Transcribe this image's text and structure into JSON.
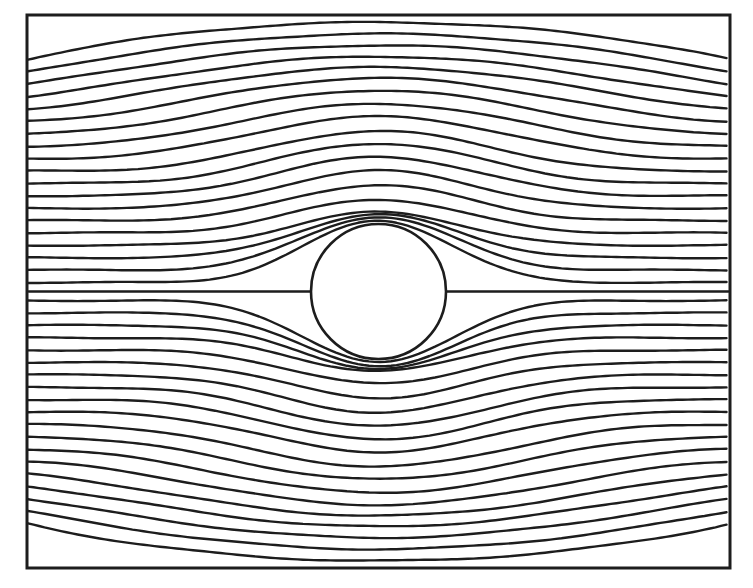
{
  "figure": {
    "background": "#ffffff",
    "ink": "#1d1d1d",
    "canvas": {
      "width": 753,
      "height": 588
    },
    "frame": {
      "x": 27,
      "y": 15,
      "width": 703,
      "height": 553,
      "stroke_width": 3.0
    },
    "cylinder": {
      "cx": 378.5,
      "cy": 291.5,
      "r": 67.5,
      "stroke_width": 2.6
    },
    "stagnation_line": {
      "y": 291.5,
      "left_x1": 28.5,
      "left_x2": 312.5,
      "right_x1": 444.5,
      "right_x2": 728.5,
      "stroke_width": 2.3
    }
  },
  "chart_data": {
    "type": "line",
    "title": "",
    "grid": false,
    "legend": false,
    "n_streamlines_per_side": 19,
    "center_x": 378.5,
    "center_y": 291.5,
    "half_width": 351.5,
    "half_height": 276.5,
    "edge_compression_k": 0.9,
    "inlet_offsets": [
      9.0,
      21.4,
      33.8,
      46.2,
      58.6,
      71.0,
      83.3,
      95.7,
      108.1,
      120.5,
      132.9,
      145.3,
      157.7,
      170.1,
      182.4,
      194.8,
      207.2,
      219.6,
      232.0
    ],
    "peak_offsets": [
      71.0,
      74.6,
      77.0,
      79.6,
      92.0,
      106.5,
      121.0,
      134.6,
      148.0,
      160.5,
      175.0,
      187.7,
      201.1,
      213.4,
      224.2,
      235.0,
      246.2,
      257.7,
      269.3
    ],
    "shape_exponents": [
      11.5,
      10.5,
      9.6,
      9.0,
      8.3,
      7.55,
      6.7,
      6.07,
      5.6,
      4.9,
      3.85,
      3.2,
      2.7,
      2.2,
      1.69,
      1.42,
      1.17,
      0.96,
      0.72
    ],
    "stream_stroke_width": 2.4,
    "wobble": {
      "amplitude": 0.55,
      "frequency": 0.032
    }
  }
}
